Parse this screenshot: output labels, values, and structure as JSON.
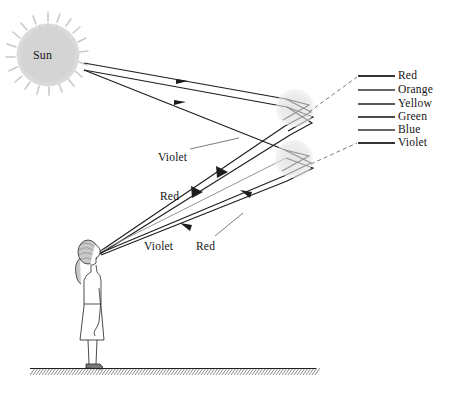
{
  "figure": {
    "type": "optics-ray-diagram",
    "background_color": "#ffffff",
    "ink_color": "#1a1a1a"
  },
  "sun": {
    "label": "Sun",
    "center": {
      "x": 48,
      "y": 55
    },
    "radius": 30,
    "fill_color": "#d4d4d4"
  },
  "raindrops": [
    {
      "name": "upper-raindrop",
      "center": {
        "x": 295,
        "y": 108
      },
      "radius": 19,
      "fill_color": "#dedede"
    },
    {
      "name": "lower-raindrop",
      "center": {
        "x": 294,
        "y": 159
      },
      "radius": 19,
      "fill_color": "#dedede"
    }
  ],
  "observer": {
    "name": "person",
    "eye": {
      "x": 99,
      "y": 253
    },
    "standing_on": "ground"
  },
  "ground": {
    "y": 368,
    "x_start": 30,
    "x_end": 316,
    "hatching": "diagonal"
  },
  "ray_labels": [
    {
      "text": "Violet",
      "x": 158,
      "y": 151
    },
    {
      "text": "Red",
      "x": 160,
      "y": 190
    },
    {
      "text": "Violet",
      "x": 144,
      "y": 240
    },
    {
      "text": "Red",
      "x": 196,
      "y": 240
    }
  ],
  "legend": {
    "title": "",
    "line_color": "#3a3a3a",
    "entries": [
      {
        "label": "Red",
        "y": 76,
        "color": "#333333"
      },
      {
        "label": "Orange",
        "y": 90,
        "color": "#333333"
      },
      {
        "label": "Yellow",
        "y": 104,
        "color": "#5a5a5a"
      },
      {
        "label": "Green",
        "y": 117,
        "color": "#4a4a4a"
      },
      {
        "label": "Blue",
        "y": 130,
        "color": "#333333"
      },
      {
        "label": "Violet",
        "y": 143,
        "color": "#333333"
      }
    ],
    "swatch_x_start": 358,
    "swatch_x_end": 395,
    "label_x": 398
  }
}
